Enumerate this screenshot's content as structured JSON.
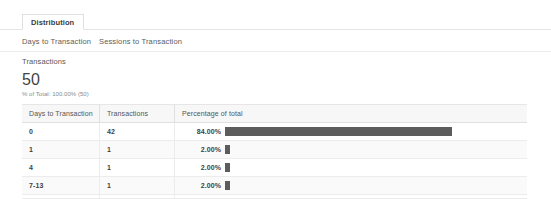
{
  "tabs": {
    "active_tab": "Distribution"
  },
  "subtabs": {
    "first": "Days to Transaction",
    "second": "Sessions to Transaction"
  },
  "metric": {
    "label": "Transactions",
    "value": "50",
    "subtext": "% of Total: 100.00% (50)"
  },
  "table": {
    "columns": [
      "Days to Transaction",
      "Transactions",
      "Percentage of total"
    ],
    "rows": [
      {
        "days": "0",
        "transactions": "42",
        "percent": "84.00%",
        "percent_value": 84
      },
      {
        "days": "1",
        "transactions": "1",
        "percent": "2.00%",
        "percent_value": 2
      },
      {
        "days": "4",
        "transactions": "1",
        "percent": "2.00%",
        "percent_value": 2
      },
      {
        "days": "7-13",
        "transactions": "1",
        "percent": "2.00%",
        "percent_value": 2
      },
      {
        "days": "14-20",
        "transactions": "5",
        "percent": "10.00%",
        "percent_value": 10
      }
    ]
  },
  "chart_data": {
    "type": "bar",
    "categories": [
      "0",
      "1",
      "4",
      "7-13",
      "14-20"
    ],
    "values": [
      84,
      2,
      2,
      2,
      10
    ],
    "counts": [
      42,
      1,
      1,
      1,
      5
    ],
    "xlabel": "Percentage of total",
    "ylabel": "Days to Transaction",
    "xlim": [
      0,
      100
    ],
    "grid": false,
    "legend": "none",
    "bar_color": "#5c5c5c",
    "total_transactions": 50
  },
  "colors": {
    "bar": "#5c5c5c",
    "text": "#444444",
    "muted": "#8a8a8a",
    "border": "#ececec",
    "header_bg": "#f7f7f7"
  }
}
